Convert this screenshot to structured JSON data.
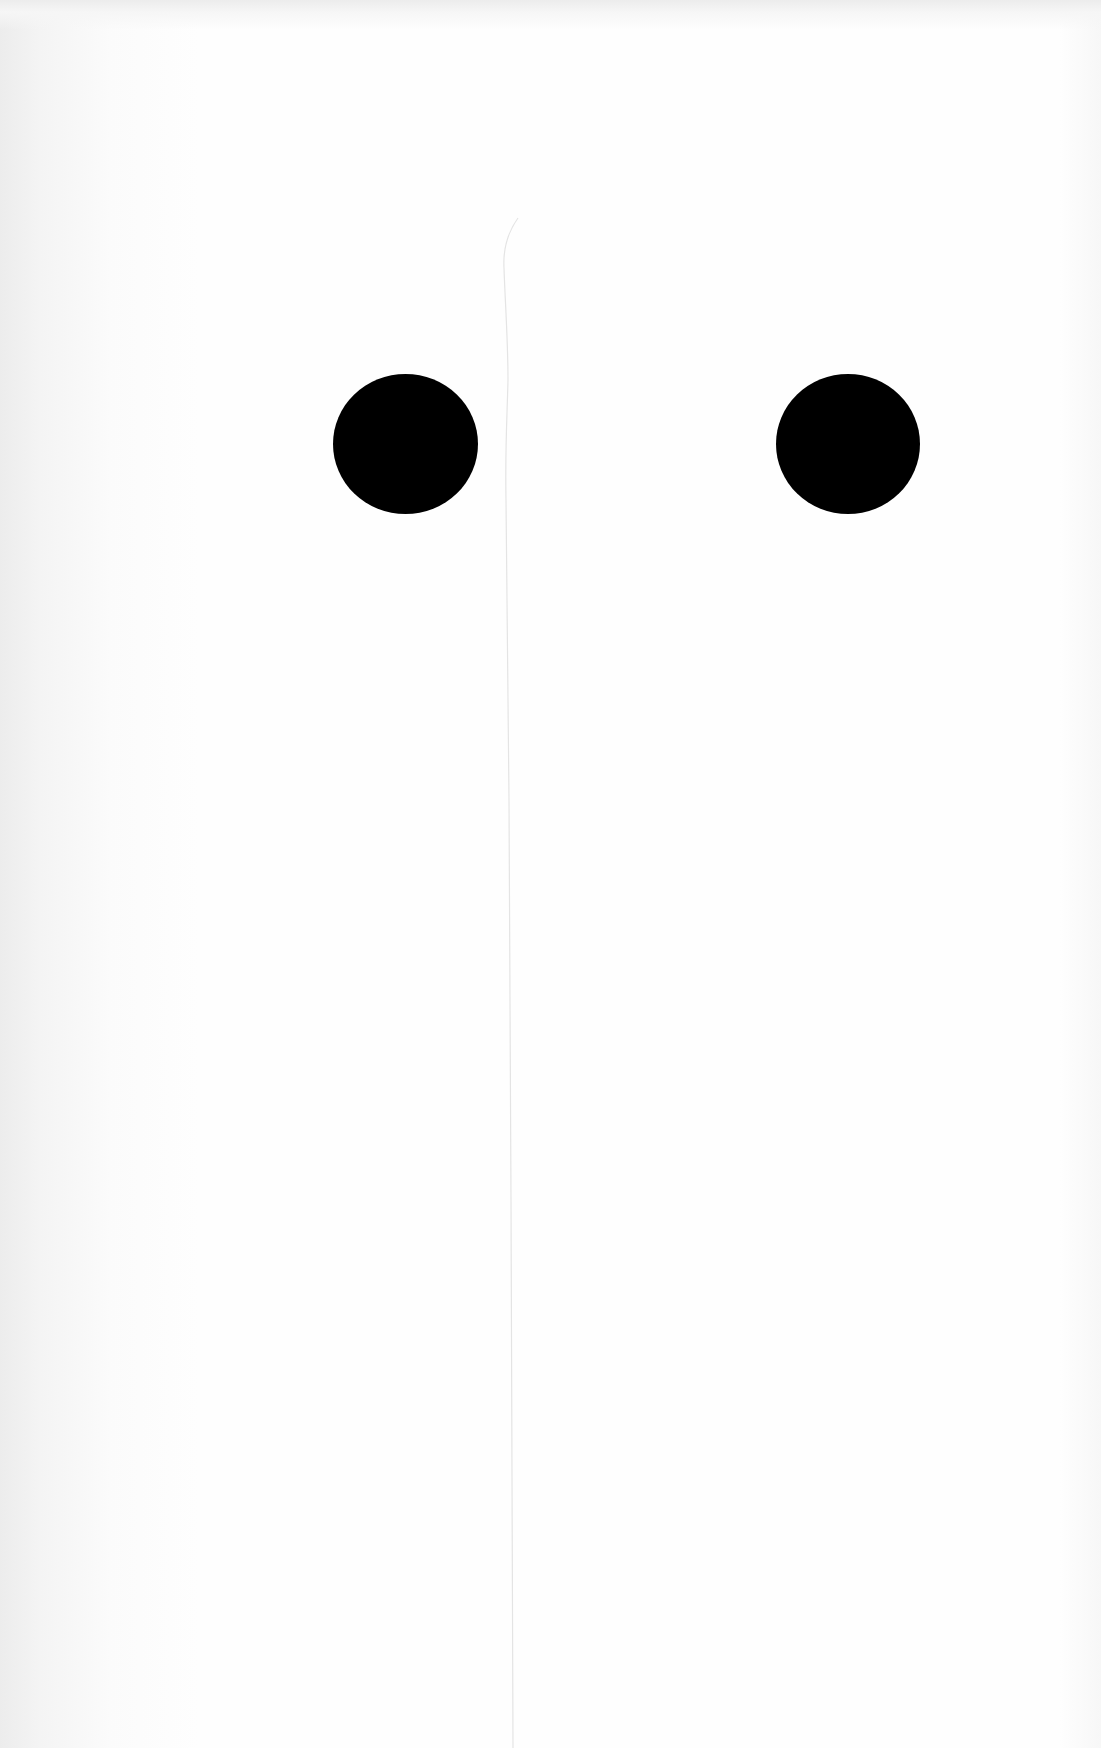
{
  "page": {
    "background_color": "#fdfdfd"
  },
  "shapes": {
    "dots": [
      {
        "name": "left-dot",
        "color": "#000000",
        "center_x": 405,
        "center_y": 444,
        "diameter": 143
      },
      {
        "name": "right-dot",
        "color": "#000000",
        "center_x": 848,
        "center_y": 444,
        "diameter": 142
      }
    ],
    "crease": {
      "color": "#e6e6e6",
      "x": 512,
      "y_start": 215,
      "y_end": 1748
    }
  }
}
